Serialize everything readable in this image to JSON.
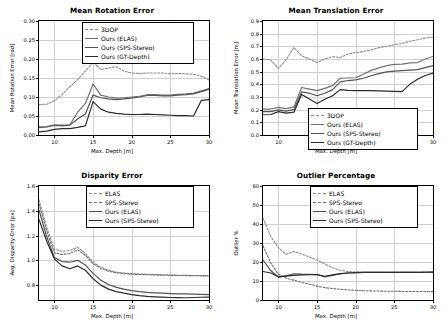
{
  "figure": {
    "width": 448,
    "height": 331,
    "background": "#ffffff",
    "xlabel_common": "Max. Depth [m]"
  },
  "colors": {
    "c1": "#8c8c8c",
    "c2": "#707070",
    "c3": "#545454",
    "c4": "#2b2b2b",
    "grid": "#cfcfcf",
    "axis": "#000000"
  },
  "chart_data": [
    {
      "id": "mean-rotation-error",
      "type": "line",
      "title": "Mean Rotation Error",
      "xlabel": "Max. Depth [m]",
      "ylabel": "Mean Rotation Error [rad]",
      "xlim": [
        8,
        30
      ],
      "ylim": [
        0.0,
        0.3
      ],
      "xticks": [
        10,
        15,
        20,
        25,
        30
      ],
      "yticks": [
        0.0,
        0.05,
        0.1,
        0.15,
        0.2,
        0.25,
        0.3
      ],
      "ytick_labels": [
        "0.00",
        "0.05",
        "0.10",
        "0.15",
        "0.20",
        "0.25",
        "0.30"
      ],
      "grid": true,
      "legend_position": "upper right",
      "x": [
        8,
        9,
        10,
        11,
        12,
        13,
        14,
        15,
        16,
        17,
        18,
        19,
        20,
        21,
        22,
        23,
        24,
        25,
        26,
        27,
        28,
        29,
        30
      ],
      "series": [
        {
          "name": "3DOP",
          "style": "dashed",
          "color": "#8c8c8c",
          "values": [
            0.08,
            0.081,
            0.09,
            0.107,
            0.127,
            0.146,
            0.168,
            0.192,
            0.172,
            0.176,
            0.18,
            0.168,
            0.163,
            0.162,
            0.163,
            0.163,
            0.163,
            0.161,
            0.162,
            0.161,
            0.16,
            0.155,
            0.145
          ]
        },
        {
          "name": "Ours (ELAS)",
          "style": "solid",
          "color": "#707070",
          "values": [
            0.021,
            0.022,
            0.027,
            0.026,
            0.027,
            0.06,
            0.083,
            0.134,
            0.105,
            0.1,
            0.097,
            0.098,
            0.1,
            0.102,
            0.106,
            0.106,
            0.105,
            0.105,
            0.107,
            0.108,
            0.11,
            0.116,
            0.122
          ]
        },
        {
          "name": "Ours (SPS-Stereo)",
          "style": "solid",
          "color": "#545454",
          "values": [
            0.02,
            0.021,
            0.025,
            0.024,
            0.026,
            0.042,
            0.055,
            0.105,
            0.098,
            0.095,
            0.093,
            0.095,
            0.097,
            0.1,
            0.104,
            0.104,
            0.103,
            0.103,
            0.105,
            0.106,
            0.108,
            0.114,
            0.12
          ]
        },
        {
          "name": "Ours (GT-Depth)",
          "style": "solid",
          "color": "#2b2b2b",
          "values": [
            0.008,
            0.01,
            0.015,
            0.017,
            0.017,
            0.02,
            0.024,
            0.088,
            0.068,
            0.06,
            0.057,
            0.055,
            0.054,
            0.054,
            0.055,
            0.054,
            0.053,
            0.052,
            0.051,
            0.051,
            0.05,
            0.091,
            0.093
          ]
        }
      ]
    },
    {
      "id": "mean-translation-error",
      "type": "line",
      "title": "Mean Translation Error",
      "xlabel": "Max. Depth [m]",
      "ylabel": "Mean Translation Error [m]",
      "xlim": [
        8,
        30
      ],
      "ylim": [
        0.0,
        0.9
      ],
      "xticks": [
        10,
        15,
        20,
        25,
        30
      ],
      "yticks": [
        0.0,
        0.1,
        0.2,
        0.3,
        0.4,
        0.5,
        0.6,
        0.7,
        0.8,
        0.9
      ],
      "ytick_labels": [
        "0.0",
        "0.1",
        "0.2",
        "0.3",
        "0.4",
        "0.5",
        "0.6",
        "0.7",
        "0.8",
        "0.9"
      ],
      "grid": true,
      "legend_position": "lower right",
      "x": [
        8,
        9,
        10,
        11,
        12,
        13,
        14,
        15,
        16,
        17,
        18,
        19,
        20,
        21,
        22,
        23,
        24,
        25,
        26,
        27,
        28,
        29,
        30
      ],
      "series": [
        {
          "name": "3DOP",
          "style": "dashed",
          "color": "#8c8c8c",
          "values": [
            0.6,
            0.592,
            0.525,
            0.594,
            0.69,
            0.625,
            0.6,
            0.572,
            0.6,
            0.618,
            0.612,
            0.64,
            0.65,
            0.66,
            0.672,
            0.69,
            0.7,
            0.714,
            0.722,
            0.74,
            0.752,
            0.766,
            0.772
          ]
        },
        {
          "name": "Ours (ELAS)",
          "style": "solid",
          "color": "#707070",
          "values": [
            0.205,
            0.205,
            0.218,
            0.208,
            0.222,
            0.375,
            0.362,
            0.35,
            0.368,
            0.39,
            0.448,
            0.45,
            0.452,
            0.48,
            0.51,
            0.53,
            0.548,
            0.558,
            0.56,
            0.57,
            0.572,
            0.6,
            0.62
          ]
        },
        {
          "name": "Ours (SPS-Stereo)",
          "style": "solid",
          "color": "#545454",
          "values": [
            0.185,
            0.185,
            0.198,
            0.188,
            0.202,
            0.34,
            0.33,
            0.31,
            0.33,
            0.358,
            0.42,
            0.43,
            0.435,
            0.448,
            0.468,
            0.485,
            0.498,
            0.505,
            0.508,
            0.512,
            0.516,
            0.532,
            0.548
          ]
        },
        {
          "name": "Ours (GT-Depth)",
          "style": "solid",
          "color": "#2b2b2b",
          "values": [
            0.16,
            0.162,
            0.185,
            0.172,
            0.18,
            0.32,
            0.285,
            0.248,
            0.282,
            0.31,
            0.358,
            0.352,
            0.35,
            0.35,
            0.35,
            0.348,
            0.346,
            0.344,
            0.342,
            0.4,
            0.44,
            0.47,
            0.488
          ]
        }
      ]
    },
    {
      "id": "disparity-error",
      "type": "line",
      "title": "Disparity Error",
      "xlabel": "Max. Depth [m]",
      "ylabel": "Avg. Disparity-Error [px]",
      "xlim": [
        8,
        30
      ],
      "ylim": [
        0.68,
        1.6
      ],
      "xticks": [
        10,
        15,
        20,
        25,
        30
      ],
      "yticks": [
        0.8,
        1.0,
        1.2,
        1.4,
        1.6
      ],
      "ytick_labels": [
        "0.8",
        "1.0",
        "1.2",
        "1.4",
        "1.6"
      ],
      "grid": true,
      "legend_position": "upper right",
      "x": [
        8,
        9,
        10,
        11,
        12,
        13,
        14,
        15,
        16,
        17,
        18,
        19,
        20,
        21,
        22,
        23,
        24,
        25,
        26,
        27,
        28,
        29,
        30
      ],
      "series": [
        {
          "name": "ELAS",
          "style": "dashed",
          "color": "#8c8c8c",
          "values": [
            1.49,
            1.265,
            1.09,
            1.072,
            1.08,
            1.105,
            1.055,
            0.985,
            0.945,
            0.92,
            0.905,
            0.898,
            0.893,
            0.89,
            0.888,
            0.886,
            0.884,
            0.882,
            0.88,
            0.879,
            0.878,
            0.877,
            0.876
          ]
        },
        {
          "name": "SPS-Stereo",
          "style": "dashed",
          "color": "#707070",
          "values": [
            1.455,
            1.235,
            1.06,
            1.048,
            1.056,
            1.085,
            1.04,
            0.972,
            0.935,
            0.912,
            0.9,
            0.893,
            0.888,
            0.886,
            0.884,
            0.882,
            0.88,
            0.879,
            0.878,
            0.877,
            0.876,
            0.875,
            0.874
          ]
        },
        {
          "name": "Ours (ELAS)",
          "style": "solid",
          "color": "#545454",
          "values": [
            1.405,
            1.19,
            1.022,
            0.99,
            0.985,
            1.0,
            0.962,
            0.895,
            0.84,
            0.805,
            0.782,
            0.768,
            0.756,
            0.748,
            0.742,
            0.738,
            0.735,
            0.732,
            0.73,
            0.729,
            0.728,
            0.726,
            0.724
          ]
        },
        {
          "name": "Ours (SPS-Stereo)",
          "style": "solid",
          "color": "#2b2b2b",
          "values": [
            1.33,
            1.155,
            1.01,
            0.955,
            0.932,
            0.955,
            0.92,
            0.852,
            0.8,
            0.768,
            0.748,
            0.735,
            0.724,
            0.716,
            0.71,
            0.706,
            0.703,
            0.7,
            0.699,
            0.698,
            0.7,
            0.702,
            0.704
          ]
        }
      ]
    },
    {
      "id": "outlier-percentage",
      "type": "line",
      "title": "Outlier Percentage",
      "xlabel": "Max. Depth [m]",
      "ylabel": "Outlier %",
      "xlim": [
        8,
        30
      ],
      "ylim": [
        0,
        60
      ],
      "xticks": [
        10,
        15,
        20,
        25,
        30
      ],
      "yticks": [
        0,
        10,
        20,
        30,
        40,
        50,
        60
      ],
      "ytick_labels": [
        "0",
        "10",
        "20",
        "30",
        "40",
        "50",
        "60"
      ],
      "grid": true,
      "legend_position": "upper right",
      "x": [
        8,
        9,
        10,
        11,
        12,
        13,
        14,
        15,
        16,
        17,
        18,
        19,
        20,
        21,
        22,
        23,
        24,
        25,
        26,
        27,
        28,
        29,
        30
      ],
      "series": [
        {
          "name": "ELAS",
          "style": "dashed",
          "color": "#8c8c8c",
          "values": [
            43.0,
            33.5,
            27.5,
            24.0,
            25.5,
            24.2,
            22.6,
            21.0,
            19.0,
            17.0,
            15.6,
            15.0,
            14.7,
            14.6,
            14.6,
            14.6,
            14.6,
            14.6,
            14.6,
            14.6,
            14.6,
            14.7,
            14.8
          ]
        },
        {
          "name": "SPS-Stereo",
          "style": "dashed",
          "color": "#707070",
          "values": [
            28.5,
            19.5,
            13.5,
            11.5,
            10.4,
            9.3,
            8.3,
            7.3,
            6.5,
            6.0,
            5.6,
            5.3,
            5.1,
            4.9,
            4.8,
            4.7,
            4.6,
            4.6,
            4.5,
            4.5,
            4.5,
            4.5,
            4.5
          ]
        },
        {
          "name": "Ours (ELAS)",
          "style": "solid",
          "color": "#545454",
          "values": [
            21.0,
            15.5,
            12.0,
            12.8,
            13.8,
            13.6,
            13.5,
            13.4,
            12.2,
            13.0,
            13.8,
            14.2,
            14.4,
            14.5,
            14.5,
            14.5,
            14.5,
            14.5,
            14.5,
            14.5,
            14.5,
            14.6,
            14.7
          ]
        },
        {
          "name": "Ours (SPS-Stereo)",
          "style": "solid",
          "color": "#2b2b2b",
          "values": [
            15.0,
            14.2,
            12.2,
            12.6,
            13.0,
            13.2,
            13.3,
            13.4,
            12.5,
            13.2,
            13.9,
            14.2,
            14.4,
            14.5,
            14.5,
            14.5,
            14.5,
            14.5,
            14.5,
            14.5,
            14.5,
            14.6,
            14.7
          ]
        }
      ]
    }
  ]
}
